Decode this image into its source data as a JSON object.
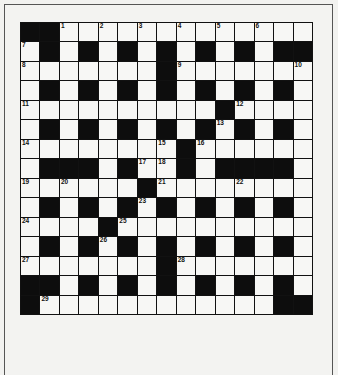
{
  "puzzle": {
    "type": "crossword",
    "rows": 15,
    "cols": 15,
    "colors": {
      "black": "#0d0d0d",
      "white": "#f7f7f5",
      "background": "#f2f2f0"
    },
    "grid": [
      "##.............#",
      ".#.#.#.#.#.#.##",
      ".......#.......",
      ".#.#.#.#.#.#.#.",
      "..........#....",
      ".#.#.#.#.#.#.#.",
      "........#......",
      ".###.#..#.####.",
      "......#........",
      ".#.#.#.#.#.#.#.",
      "....#..........",
      ".#.#.#.#.#.#.#.",
      ".......#.......",
      "##.#.#.#.#.#.#.",
      "#............##"
    ],
    "numbers": [
      {
        "row": 0,
        "col": 2,
        "n": "1"
      },
      {
        "row": 0,
        "col": 4,
        "n": "2"
      },
      {
        "row": 0,
        "col": 6,
        "n": "3"
      },
      {
        "row": 0,
        "col": 8,
        "n": "4"
      },
      {
        "row": 0,
        "col": 10,
        "n": "5"
      },
      {
        "row": 0,
        "col": 12,
        "n": "6"
      },
      {
        "row": 1,
        "col": 0,
        "n": "7"
      },
      {
        "row": 2,
        "col": 0,
        "n": "8"
      },
      {
        "row": 2,
        "col": 8,
        "n": "9"
      },
      {
        "row": 2,
        "col": 14,
        "n": "10"
      },
      {
        "row": 4,
        "col": 0,
        "n": "11"
      },
      {
        "row": 4,
        "col": 11,
        "n": "12"
      },
      {
        "row": 5,
        "col": 10,
        "n": "13"
      },
      {
        "row": 6,
        "col": 0,
        "n": "14"
      },
      {
        "row": 6,
        "col": 7,
        "n": "15"
      },
      {
        "row": 6,
        "col": 9,
        "n": "16"
      },
      {
        "row": 7,
        "col": 6,
        "n": "17"
      },
      {
        "row": 7,
        "col": 7,
        "n": "18"
      },
      {
        "row": 8,
        "col": 0,
        "n": "19"
      },
      {
        "row": 8,
        "col": 2,
        "n": "20"
      },
      {
        "row": 8,
        "col": 7,
        "n": "21"
      },
      {
        "row": 8,
        "col": 11,
        "n": "22"
      },
      {
        "row": 9,
        "col": 6,
        "n": "23"
      },
      {
        "row": 10,
        "col": 0,
        "n": "24"
      },
      {
        "row": 10,
        "col": 5,
        "n": "25"
      },
      {
        "row": 11,
        "col": 4,
        "n": "26"
      },
      {
        "row": 12,
        "col": 0,
        "n": "27"
      },
      {
        "row": 12,
        "col": 8,
        "n": "28"
      },
      {
        "row": 14,
        "col": 1,
        "n": "29"
      }
    ]
  }
}
